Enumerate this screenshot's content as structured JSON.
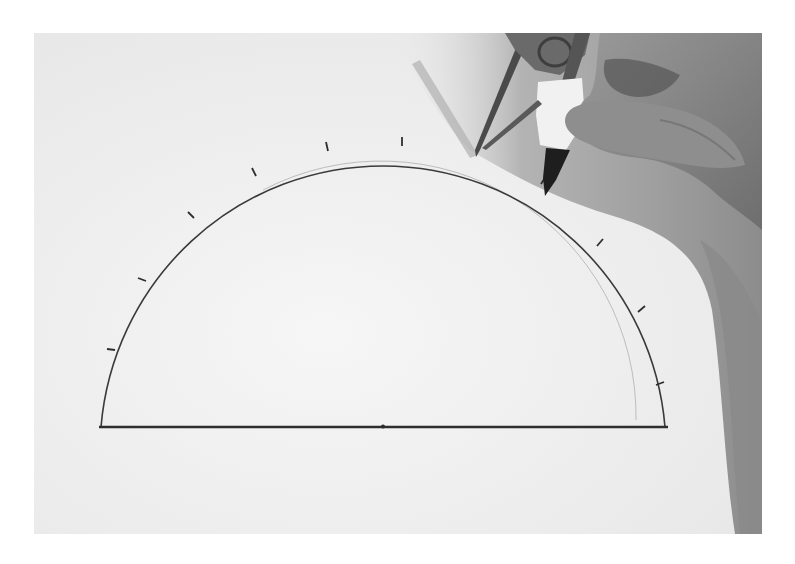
{
  "image": {
    "description": "Grayscale photograph of a hand holding a drawing compass marking tick points along a pencil-drawn semicircle on white paper",
    "style": "grayscale photo",
    "frame": {
      "x": 34,
      "y": 33,
      "width": 728,
      "height": 501
    }
  },
  "colors": {
    "paper": "#ededed",
    "paper_light": "#f4f4f4",
    "shadow": "#9a9a9a",
    "shadow_dark": "#7c7c7c",
    "line": "#3a3a3a",
    "guide_line": "#b8b8b8",
    "hand": "#8a8a8a",
    "compass_metal": "#555555",
    "tape": "#f2f2f2"
  },
  "drawing": {
    "baseline": {
      "x1": 100,
      "x2": 667,
      "y": 427
    },
    "center": {
      "x": 383,
      "y": 427
    },
    "outer_radius": 284,
    "inner_guide_radius": 255,
    "tick_count": 14,
    "center_mark": true
  },
  "objects": [
    {
      "name": "compass",
      "position": "upper-right",
      "needle_tip": {
        "x": 476,
        "y": 157
      },
      "pencil_tip": {
        "x": 544,
        "y": 196
      }
    },
    {
      "name": "hand",
      "position": "upper-right"
    },
    {
      "name": "hand-shadow",
      "position": "right edge"
    }
  ]
}
